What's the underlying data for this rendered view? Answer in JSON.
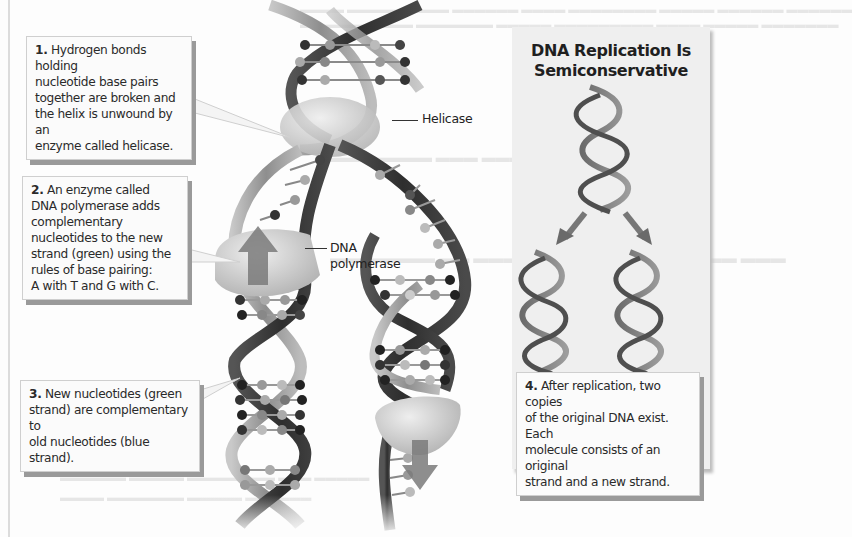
{
  "figure": {
    "title": "DNA Replication Is Semiconservative",
    "title_lines": [
      "DNA Replication Is",
      "Semiconservative"
    ],
    "colors": {
      "background": "#fdfdfd",
      "panel": "#efefef",
      "callout_bg": "#fbfbfb",
      "callout_shadow": "#9a9a9a",
      "backbone_dark": "#3a3a3a",
      "backbone_light": "#a8a8a8",
      "enzyme": "#cfcfcf",
      "arrow": "#7a7a7a"
    }
  },
  "callouts": [
    {
      "number": "1.",
      "lines": [
        "Hydrogen bonds holding",
        "nucleotide base pairs",
        "together are broken and",
        "the helix is unwound by an",
        "enzyme called helicase."
      ]
    },
    {
      "number": "2.",
      "lines": [
        "An enzyme called",
        "DNA polymerase adds",
        "complementary",
        "nucleotides to the new",
        "strand (green) using the",
        "rules of base pairing:",
        "A with T and G with C."
      ]
    },
    {
      "number": "3.",
      "lines": [
        "New nucleotides (green",
        "strand) are complementary to",
        "old nucleotides (blue strand)."
      ]
    },
    {
      "number": "4.",
      "lines": [
        "After replication, two copies",
        "of the original DNA exist. Each",
        "molecule consists of an original",
        "strand and a new strand."
      ]
    }
  ],
  "labels": {
    "helicase": "Helicase",
    "polymerase_lines": [
      "DNA",
      "polymerase"
    ]
  }
}
